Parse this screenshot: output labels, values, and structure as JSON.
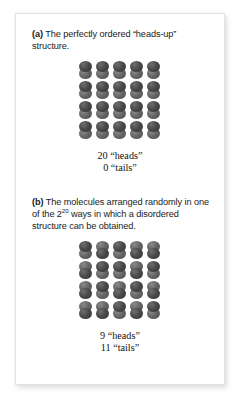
{
  "figure": {
    "panels": [
      {
        "id": "a",
        "label": "(a)",
        "caption_text": " The perfectly ordered “heads-up” structure.",
        "caption_plain": "(a) The perfectly ordered “heads-up” structure.",
        "grid": {
          "columns": 5,
          "rows": 4,
          "count": 20,
          "orientations": [
            "heads",
            "heads",
            "heads",
            "heads",
            "heads",
            "heads",
            "heads",
            "heads",
            "heads",
            "heads",
            "heads",
            "heads",
            "heads",
            "heads",
            "heads",
            "heads",
            "heads",
            "heads",
            "heads",
            "heads"
          ]
        },
        "tally": {
          "heads_line": "20 “heads”",
          "tails_line": "0 “tails”",
          "heads_count": 20,
          "tails_count": 0
        }
      },
      {
        "id": "b",
        "label": "(b)",
        "caption_before_sup": " The molecules arranged randomly in one of the 2",
        "caption_sup": "20",
        "caption_after_sup": " ways in which a disordered structure can be obtained.",
        "caption_plain": "(b) The molecules arranged randomly in one of the 2^20 ways in which a disordered structure can be obtained.",
        "grid": {
          "columns": 5,
          "rows": 4,
          "count": 20,
          "orientations": [
            "heads",
            "tails",
            "heads",
            "tails",
            "tails",
            "tails",
            "heads",
            "heads",
            "tails",
            "heads",
            "tails",
            "heads",
            "tails",
            "heads",
            "tails",
            "tails",
            "tails",
            "heads",
            "tails",
            "heads"
          ]
        },
        "tally": {
          "heads_line": "9 “heads”",
          "tails_line": "11 “tails”",
          "heads_count": 9,
          "tails_count": 11
        }
      }
    ],
    "colors": {
      "page_background": "#ffffff",
      "card_background": "#ffffff",
      "card_border": "#e3e3e3",
      "text": "#1a1a1a",
      "tally_text": "#111111",
      "molecule_head_dark": "#3a3a3a",
      "molecule_head_light": "#646464"
    }
  }
}
